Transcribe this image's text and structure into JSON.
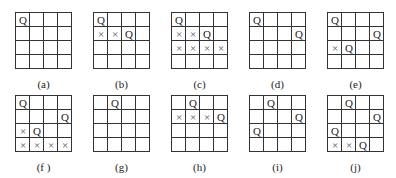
{
  "figure": {
    "grid_size": 4,
    "panels": [
      {
        "id": "a",
        "label": "(a)",
        "queens": [
          [
            0,
            0
          ]
        ],
        "crosses": []
      },
      {
        "id": "b",
        "label": "(b)",
        "queens": [
          [
            0,
            0
          ],
          [
            1,
            2
          ]
        ],
        "crosses": [
          [
            1,
            0
          ],
          [
            1,
            1
          ]
        ]
      },
      {
        "id": "c",
        "label": "(c)",
        "queens": [
          [
            0,
            0
          ],
          [
            1,
            2
          ]
        ],
        "crosses": [
          [
            1,
            0
          ],
          [
            1,
            1
          ],
          [
            2,
            0
          ],
          [
            2,
            1
          ],
          [
            2,
            2
          ],
          [
            2,
            3
          ]
        ]
      },
      {
        "id": "d",
        "label": "(d)",
        "queens": [
          [
            0,
            0
          ],
          [
            1,
            3
          ]
        ],
        "crosses": []
      },
      {
        "id": "e",
        "label": "(e)",
        "queens": [
          [
            0,
            0
          ],
          [
            1,
            3
          ],
          [
            2,
            1
          ]
        ],
        "crosses": [
          [
            2,
            0
          ]
        ]
      },
      {
        "id": "f",
        "label": "(f )",
        "queens": [
          [
            0,
            0
          ],
          [
            1,
            3
          ],
          [
            2,
            1
          ]
        ],
        "crosses": [
          [
            2,
            0
          ],
          [
            3,
            0
          ],
          [
            3,
            1
          ],
          [
            3,
            2
          ],
          [
            3,
            3
          ]
        ]
      },
      {
        "id": "g",
        "label": "(g)",
        "queens": [
          [
            0,
            1
          ]
        ],
        "crosses": []
      },
      {
        "id": "h",
        "label": "(h)",
        "queens": [
          [
            0,
            1
          ],
          [
            1,
            3
          ]
        ],
        "crosses": [
          [
            1,
            0
          ],
          [
            1,
            1
          ],
          [
            1,
            2
          ]
        ]
      },
      {
        "id": "i",
        "label": "(i)",
        "queens": [
          [
            0,
            1
          ],
          [
            1,
            3
          ],
          [
            2,
            0
          ]
        ],
        "crosses": []
      },
      {
        "id": "j",
        "label": "(j)",
        "queens": [
          [
            0,
            1
          ],
          [
            1,
            3
          ],
          [
            2,
            0
          ],
          [
            3,
            2
          ]
        ],
        "crosses": [
          [
            3,
            0
          ],
          [
            3,
            1
          ]
        ]
      }
    ],
    "queen_symbol": "Q",
    "cross_symbol": "×"
  }
}
